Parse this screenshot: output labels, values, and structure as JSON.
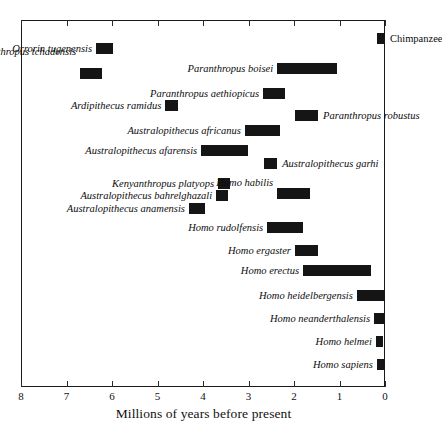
{
  "figure": {
    "xlabel": "Millions of years before present",
    "x_ticks": [
      "8",
      "7",
      "6",
      "5",
      "4",
      "3",
      "2",
      "1",
      "0"
    ],
    "axis_color": "#1a1a1a",
    "bar_color": "#151515",
    "background": "#ffffff"
  },
  "chart_data": {
    "type": "bar",
    "orientation": "horizontal",
    "title": "",
    "xlabel": "Millions of years before present",
    "ylabel": "",
    "xlim": [
      8,
      0
    ],
    "x_reversed": true,
    "x_ticks": [
      8,
      7,
      6,
      5,
      4,
      3,
      2,
      1,
      0
    ],
    "grid": false,
    "legend": null,
    "note": "Each bar is the temporal range (start, end) in millions of years before present for one hominin taxon.",
    "categories": [
      "Chimpanzee",
      "Orrorin tugenensis",
      "Sahelanthropus tchadensis",
      "Paranthropus boisei",
      "Paranthropus aethiopicus",
      "Ardipithecus ramidus",
      "Paranthropus robustus",
      "Australopithecus africanus",
      "Australopithecus afarensis",
      "Australopithecus garhi",
      "Kenyanthropus platyops",
      "Australopithecus bahrelghazali",
      "Homo habilis",
      "Australopithecus anamensis",
      "Homo rudolfensis",
      "Homo ergaster",
      "Homo erectus",
      "Homo heidelbergensis",
      "Homo neanderthalensis",
      "Homo helmei",
      "Homo sapiens"
    ],
    "ranges": [
      {
        "name": "Chimpanzee",
        "start": 0.18,
        "end": 0.0,
        "italic": false
      },
      {
        "name": "Orrorin tugenensis",
        "start": 6.35,
        "end": 5.97,
        "italic": true
      },
      {
        "name": "Sahelanthropus tchadensis",
        "start": 6.7,
        "end": 6.22,
        "italic": true
      },
      {
        "name": "Paranthropus boisei",
        "start": 2.37,
        "end": 1.05,
        "italic": true
      },
      {
        "name": "Paranthropus aethiopicus",
        "start": 2.68,
        "end": 2.2,
        "italic": true
      },
      {
        "name": "Ardipithecus ramidus",
        "start": 4.83,
        "end": 4.55,
        "italic": true
      },
      {
        "name": "Paranthropus robustus",
        "start": 1.98,
        "end": 1.47,
        "italic": true
      },
      {
        "name": "Australopithecus africanus",
        "start": 3.08,
        "end": 2.31,
        "italic": true
      },
      {
        "name": "Australopithecus afarensis",
        "start": 4.04,
        "end": 3.01,
        "italic": true
      },
      {
        "name": "Australopithecus garhi",
        "start": 2.66,
        "end": 2.37,
        "italic": true
      },
      {
        "name": "Kenyanthropus platyops",
        "start": 3.67,
        "end": 3.41,
        "italic": true
      },
      {
        "name": "Australopithecus bahrelghazali",
        "start": 3.71,
        "end": 3.45,
        "italic": true
      },
      {
        "name": "Homo habilis",
        "start": 2.37,
        "end": 1.65,
        "italic": true
      },
      {
        "name": "Australopithecus anamensis",
        "start": 4.31,
        "end": 3.96,
        "italic": true
      },
      {
        "name": "Homo rudolfensis",
        "start": 2.59,
        "end": 1.8,
        "italic": true
      },
      {
        "name": "Homo ergaster",
        "start": 1.98,
        "end": 1.47,
        "italic": true
      },
      {
        "name": "Homo erectus",
        "start": 1.8,
        "end": 0.31,
        "italic": true
      },
      {
        "name": "Homo heidelbergensis",
        "start": 0.62,
        "end": 0.0,
        "italic": true
      },
      {
        "name": "Homo neanderthalensis",
        "start": 0.24,
        "end": 0.0,
        "italic": true
      },
      {
        "name": "Homo helmei",
        "start": 0.2,
        "end": 0.04,
        "italic": true
      },
      {
        "name": "Homo sapiens",
        "start": 0.18,
        "end": 0.0,
        "italic": true
      }
    ],
    "row_pixel_tops": [
      33,
      43,
      68,
      63,
      88,
      100,
      110,
      125,
      145,
      158,
      178,
      190,
      188,
      203,
      222,
      245,
      265,
      290,
      313,
      336,
      359
    ],
    "label_sides": [
      "right",
      "left",
      "left",
      "left",
      "left",
      "left",
      "right",
      "left",
      "left",
      "right",
      "left",
      "left",
      "left",
      "left",
      "left",
      "left",
      "left",
      "left",
      "left",
      "left",
      "left"
    ],
    "label_pixel_offsets": [
      0,
      0,
      -22,
      0,
      0,
      0,
      0,
      0,
      0,
      0,
      0,
      0,
      -11,
      0,
      0,
      0,
      0,
      0,
      0,
      0,
      0
    ]
  }
}
